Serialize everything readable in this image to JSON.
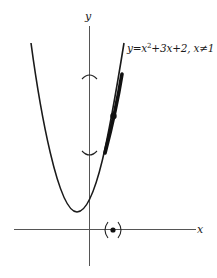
{
  "figure": {
    "axes": {
      "x_label": "x",
      "y_label": "y"
    },
    "curve": {
      "equation_prefix": "y=x",
      "exponent": "2",
      "equation_suffix": "+3x+2, x≠1",
      "full_label": "y=x^2+3x+2, x≠1",
      "color": "#1a1a1a"
    },
    "annotations": {
      "highlighted_segment": "thick portion of the curve mapped into the y-interval neighborhood",
      "y_interval_brackets": [
        "⌢",
        "⌣"
      ],
      "x_neighborhood_marker": "(•)"
    },
    "colors": {
      "ink": "#1a1a1a",
      "axis": "#555555",
      "background": "#ffffff"
    }
  }
}
